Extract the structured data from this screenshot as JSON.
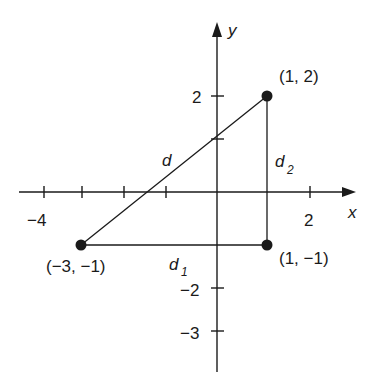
{
  "diagram": {
    "type": "coordinate-plane-right-triangle",
    "axes": {
      "x_label": "x",
      "y_label": "y",
      "x_tick_labels": [
        {
          "value": -4,
          "text": "−4"
        },
        {
          "value": 2,
          "text": "2"
        }
      ],
      "y_tick_labels": [
        {
          "value": 2,
          "text": "2"
        },
        {
          "value": -2,
          "text": "−2"
        },
        {
          "value": -3,
          "text": "−3"
        }
      ]
    },
    "points": [
      {
        "id": "A",
        "coords": [
          -3,
          -1
        ],
        "label": "(−3, −1)"
      },
      {
        "id": "B",
        "coords": [
          1,
          -1
        ],
        "label": "(1, −1)"
      },
      {
        "id": "C",
        "coords": [
          1,
          2
        ],
        "label": "(1, 2)"
      }
    ],
    "segments": [
      {
        "from": "A",
        "to": "C",
        "label": "d"
      },
      {
        "from": "A",
        "to": "B",
        "label": "d",
        "subscript": "1"
      },
      {
        "from": "B",
        "to": "C",
        "label": "d",
        "subscript": "2"
      }
    ],
    "colors": {
      "ink": "#1a1a1a",
      "background": "#ffffff"
    }
  }
}
